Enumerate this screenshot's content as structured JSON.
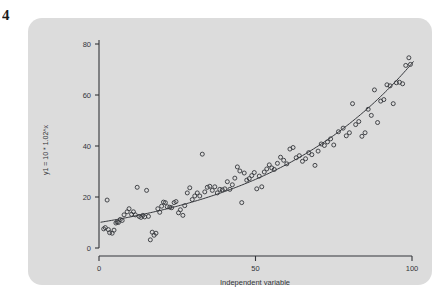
{
  "figure": {
    "panel_color": "#dcdcdc",
    "ink_color": "#33353a",
    "corner_mark": "4"
  },
  "chart_data": {
    "type": "scatter",
    "title": "",
    "subtitle": "",
    "xlabel": "Independent variable",
    "ylabel": "y1 = 10 * 1.02^x",
    "xlim": [
      0,
      104
    ],
    "ylim": [
      0,
      84
    ],
    "xticks": [
      0,
      50,
      100
    ],
    "xticklabels": [
      "0",
      "50",
      "100"
    ],
    "yticks": [
      0,
      20,
      40,
      60,
      80
    ],
    "yticklabels": [
      "0",
      "20",
      "40",
      "60",
      "80"
    ],
    "grid": false,
    "legend": null,
    "legend_position": "none",
    "marker": "open-circle",
    "marker_size": 4,
    "fit_curve": {
      "label": "y1 = 10 * 1.02^x",
      "type": "exponential",
      "a": 10,
      "b": 1.02,
      "color": "#33353a",
      "width": 1
    },
    "annotations": [],
    "x": [
      1.5,
      2.0,
      2.6,
      3.0,
      3.4,
      4.2,
      4.8,
      5.4,
      5.8,
      6.2,
      6.8,
      7.4,
      8.0,
      9.0,
      9.6,
      10.4,
      11.0,
      11.6,
      12.2,
      12.8,
      13.4,
      14.0,
      14.6,
      15.2,
      15.8,
      16.4,
      17.0,
      17.6,
      18.2,
      18.8,
      19.4,
      20.0,
      20.6,
      21.2,
      21.8,
      22.6,
      23.2,
      24.0,
      24.6,
      25.4,
      26.0,
      26.8,
      27.4,
      28.2,
      29.0,
      29.8,
      30.6,
      31.4,
      32.2,
      33.0,
      33.8,
      34.6,
      35.4,
      36.2,
      37.0,
      37.8,
      38.6,
      39.4,
      40.2,
      41.0,
      41.8,
      42.6,
      43.4,
      44.2,
      45.0,
      45.6,
      46.4,
      47.2,
      48.0,
      48.8,
      49.6,
      50.4,
      51.2,
      52.0,
      52.8,
      53.6,
      54.4,
      55.2,
      56.0,
      57.0,
      58.0,
      59.0,
      60.0,
      61.0,
      62.0,
      63.0,
      64.0,
      65.0,
      66.0,
      67.0,
      68.0,
      69.0,
      70.0,
      71.0,
      72.0,
      73.0,
      74.0,
      75.0,
      76.5,
      78.0,
      79.0,
      80.0,
      81.0,
      82.0,
      83.0,
      84.0,
      85.0,
      86.0,
      87.0,
      88.0,
      89.0,
      90.0,
      91.0,
      92.0,
      93.0,
      94.0,
      95.0,
      96.0,
      97.0,
      98.0,
      99.0,
      99.5
    ],
    "y": [
      7.5,
      8.0,
      18.8,
      7.2,
      6.0,
      5.8,
      7.0,
      9.8,
      10.2,
      10.0,
      11.2,
      10.8,
      13.0,
      14.2,
      15.4,
      13.2,
      14.2,
      13.0,
      23.8,
      12.4,
      12.0,
      12.8,
      12.2,
      22.6,
      12.4,
      3.2,
      6.2,
      5.0,
      5.8,
      15.4,
      14.0,
      16.4,
      18.0,
      17.8,
      16.2,
      16.0,
      15.8,
      17.8,
      18.2,
      13.8,
      15.0,
      12.8,
      16.6,
      21.6,
      23.6,
      19.0,
      20.4,
      21.6,
      20.4,
      36.8,
      22.0,
      23.8,
      24.2,
      22.6,
      24.0,
      21.6,
      23.0,
      22.8,
      23.2,
      26.0,
      23.0,
      24.8,
      27.4,
      31.8,
      30.2,
      17.8,
      29.4,
      26.6,
      27.2,
      28.4,
      29.6,
      23.2,
      28.2,
      24.0,
      29.8,
      31.0,
      32.6,
      31.4,
      30.8,
      33.2,
      35.6,
      34.4,
      33.0,
      38.8,
      39.4,
      35.4,
      36.2,
      34.0,
      35.0,
      37.4,
      36.6,
      32.4,
      38.0,
      40.8,
      40.2,
      41.6,
      42.8,
      40.4,
      45.6,
      47.0,
      44.0,
      45.2,
      56.6,
      48.4,
      49.6,
      43.8,
      45.2,
      54.4,
      52.0,
      62.0,
      49.2,
      57.6,
      58.2,
      64.0,
      63.6,
      56.6,
      64.8,
      65.0,
      64.4,
      71.6,
      74.6,
      72.0
    ]
  }
}
